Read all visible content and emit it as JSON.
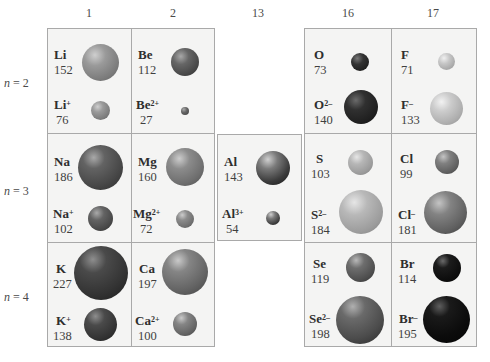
{
  "group_labels": [
    "1",
    "2",
    "13",
    "16",
    "17"
  ],
  "period_labels": [
    {
      "n": "n",
      "eq": " = 2"
    },
    {
      "n": "n",
      "eq": " = 3"
    },
    {
      "n": "n",
      "eq": " = 4"
    }
  ],
  "cells": {
    "Li": {
      "symbol": "Li",
      "charge": "",
      "radius": "152",
      "color": "#8a8a8a"
    },
    "Li+": {
      "symbol": "Li",
      "charge": "+",
      "radius": "76",
      "color": "#8a8a8a"
    },
    "Be": {
      "symbol": "Be",
      "charge": "",
      "radius": "112",
      "color": "#555555"
    },
    "Be2+": {
      "symbol": "Be",
      "charge": "2+",
      "radius": "27",
      "color": "#5a5a5a"
    },
    "Na": {
      "symbol": "Na",
      "charge": "",
      "radius": "186",
      "color": "#505050"
    },
    "Na+": {
      "symbol": "Na",
      "charge": "+",
      "radius": "102",
      "color": "#505050"
    },
    "Mg": {
      "symbol": "Mg",
      "charge": "",
      "radius": "160",
      "color": "#7a7a7a"
    },
    "Mg2+": {
      "symbol": "Mg",
      "charge": "2+",
      "radius": "72",
      "color": "#7a7a7a"
    },
    "Al": {
      "symbol": "Al",
      "charge": "",
      "radius": "143",
      "color": "#3f3f3f"
    },
    "Al3+": {
      "symbol": "Al",
      "charge": "3+",
      "radius": "54",
      "color": "#444444"
    },
    "O": {
      "symbol": "O",
      "charge": "",
      "radius": "73",
      "color": "#2c2c2c"
    },
    "O2-": {
      "symbol": "O",
      "charge": "2–",
      "radius": "140",
      "color": "#2a2a2a"
    },
    "F": {
      "symbol": "F",
      "charge": "",
      "radius": "71",
      "color": "#b5b5b5"
    },
    "F-": {
      "symbol": "F",
      "charge": "–",
      "radius": "133",
      "color": "#b5b5b5"
    },
    "S": {
      "symbol": "S",
      "charge": "",
      "radius": "103",
      "color": "#a8a8a8"
    },
    "S2-": {
      "symbol": "S",
      "charge": "2–",
      "radius": "184",
      "color": "#a8a8a8"
    },
    "Cl": {
      "symbol": "Cl",
      "charge": "",
      "radius": "99",
      "color": "#6c6c6c"
    },
    "Cl-": {
      "symbol": "Cl",
      "charge": "–",
      "radius": "181",
      "color": "#6c6c6c"
    },
    "K": {
      "symbol": "K",
      "charge": "",
      "radius": "227",
      "color": "#3a3a3a"
    },
    "K+": {
      "symbol": "K",
      "charge": "+",
      "radius": "138",
      "color": "#3a3a3a"
    },
    "Ca": {
      "symbol": "Ca",
      "charge": "",
      "radius": "197",
      "color": "#727272"
    },
    "Ca2+": {
      "symbol": "Ca",
      "charge": "2+",
      "radius": "100",
      "color": "#727272"
    },
    "Se": {
      "symbol": "Se",
      "charge": "",
      "radius": "119",
      "color": "#5c5c5c"
    },
    "Se2-": {
      "symbol": "Se",
      "charge": "2–",
      "radius": "198",
      "color": "#5c5c5c"
    },
    "Br": {
      "symbol": "Br",
      "charge": "",
      "radius": "114",
      "color": "#111111"
    },
    "Br-": {
      "symbol": "Br",
      "charge": "–",
      "radius": "195",
      "color": "#0d0d0d"
    }
  }
}
